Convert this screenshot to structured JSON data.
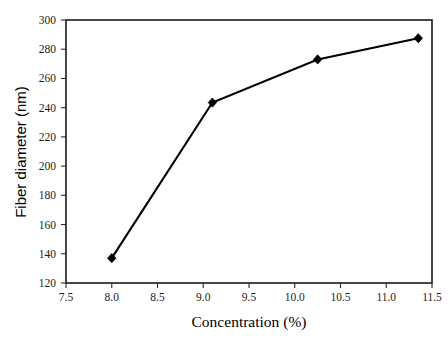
{
  "chart_data": {
    "type": "line",
    "title": "",
    "subtitle": "",
    "xlabel": "Concentration (%)",
    "ylabel": "Fiber diameter (nm)",
    "xlim": [
      7.5,
      11.5
    ],
    "ylim": [
      120,
      300
    ],
    "xticks": [
      7.5,
      8.0,
      8.5,
      9.0,
      9.5,
      10.0,
      10.5,
      11.0,
      11.5
    ],
    "xtick_labels": [
      "7.5",
      "8.0",
      "8.5",
      "9.0",
      "9.5",
      "10.0",
      "10.5",
      "11.0",
      "11.5"
    ],
    "yticks": [
      120,
      140,
      160,
      180,
      200,
      220,
      240,
      260,
      280,
      300
    ],
    "ytick_labels": [
      "120",
      "140",
      "160",
      "180",
      "200",
      "220",
      "240",
      "260",
      "280",
      "300"
    ],
    "grid": false,
    "legend": false,
    "legend_position": "none",
    "marker": "diamond",
    "line_color": "#000000",
    "marker_color": "#000000",
    "background_color": "#ffffff",
    "x": [
      8.0,
      9.1,
      10.25,
      11.35
    ],
    "y": [
      137,
      243.5,
      273,
      287.5
    ],
    "series": [
      {
        "name": "Fiber diameter",
        "x": [
          8.0,
          9.1,
          10.25,
          11.35
        ],
        "values": [
          137,
          243.5,
          273,
          287.5
        ]
      }
    ],
    "annotations": []
  },
  "figure": {
    "name": "fiber-diameter-vs-concentration-plot"
  }
}
